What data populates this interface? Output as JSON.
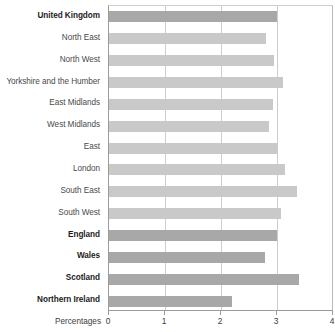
{
  "chart_data": {
    "type": "bar",
    "orientation": "horizontal",
    "title": "",
    "subtitle": "",
    "xlabel": "Percentages",
    "ylabel": "",
    "xlim": [
      0,
      4
    ],
    "xticks": [
      0,
      1,
      2,
      3,
      4
    ],
    "xtick_labels": [
      "0",
      "1",
      "2",
      "3",
      "4"
    ],
    "grid": true,
    "gridlines_axis": "x",
    "legend": null,
    "legend_position": "none",
    "categories": [
      "United Kingdom",
      "North East",
      "North West",
      "Yorkshire and the Humber",
      "East Midlands",
      "West Midlands",
      "East",
      "London",
      "South East",
      "South West",
      "England",
      "Wales",
      "Scotland",
      "Northern Ireland"
    ],
    "values": [
      3.0,
      2.8,
      2.95,
      3.1,
      2.93,
      2.86,
      3.0,
      3.15,
      3.35,
      3.07,
      3.0,
      2.78,
      3.4,
      2.2
    ],
    "bar_styles": [
      "country",
      "region",
      "region",
      "region",
      "region",
      "region",
      "region",
      "region",
      "region",
      "region",
      "country",
      "country",
      "country",
      "country"
    ],
    "label_weights": [
      "country",
      "region",
      "region",
      "region",
      "region",
      "region",
      "region",
      "region",
      "region",
      "region",
      "country",
      "country",
      "country",
      "country"
    ],
    "colors": {
      "country_bar": "#a8a8a8",
      "region_bar": "#c9c9c9",
      "gridline": "#cdcdcd",
      "axis": "#9b9b9b",
      "label_text": "#3b3b3b",
      "background": "#ffffff"
    }
  }
}
